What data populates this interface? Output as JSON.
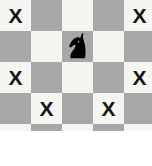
{
  "scene": {
    "type": "chessboard-fragment",
    "title": "Chess knight move visualization",
    "board": {
      "columns": 5,
      "rows": 4,
      "cell_size_px": 31,
      "visible_width_px": 152,
      "visible_height_px": 131,
      "light_square_color": "#f5f5f2",
      "dark_square_color": "#a8a8a8",
      "background_color": "#ffffff",
      "top_left_square_shade": "light"
    },
    "marks": {
      "glyph": "X",
      "label": "move-target-mark",
      "color": "#151515",
      "cells": [
        {
          "row": 0,
          "col": 0
        },
        {
          "row": 0,
          "col": 4
        },
        {
          "row": 2,
          "col": 0
        },
        {
          "row": 2,
          "col": 4
        },
        {
          "row": 3,
          "col": 1
        },
        {
          "row": 3,
          "col": 3
        }
      ]
    },
    "pieces": [
      {
        "name": "knight",
        "color": "black",
        "color_hex": "#000000",
        "row": 1,
        "col": 2,
        "square_shade": "dark"
      }
    ],
    "grid_shades": [
      [
        "light",
        "dark",
        "light",
        "dark",
        "light"
      ],
      [
        "dark",
        "light",
        "dark",
        "light",
        "dark"
      ],
      [
        "light",
        "dark",
        "light",
        "dark",
        "light"
      ],
      [
        "dark",
        "light",
        "dark",
        "light",
        "dark"
      ]
    ]
  }
}
